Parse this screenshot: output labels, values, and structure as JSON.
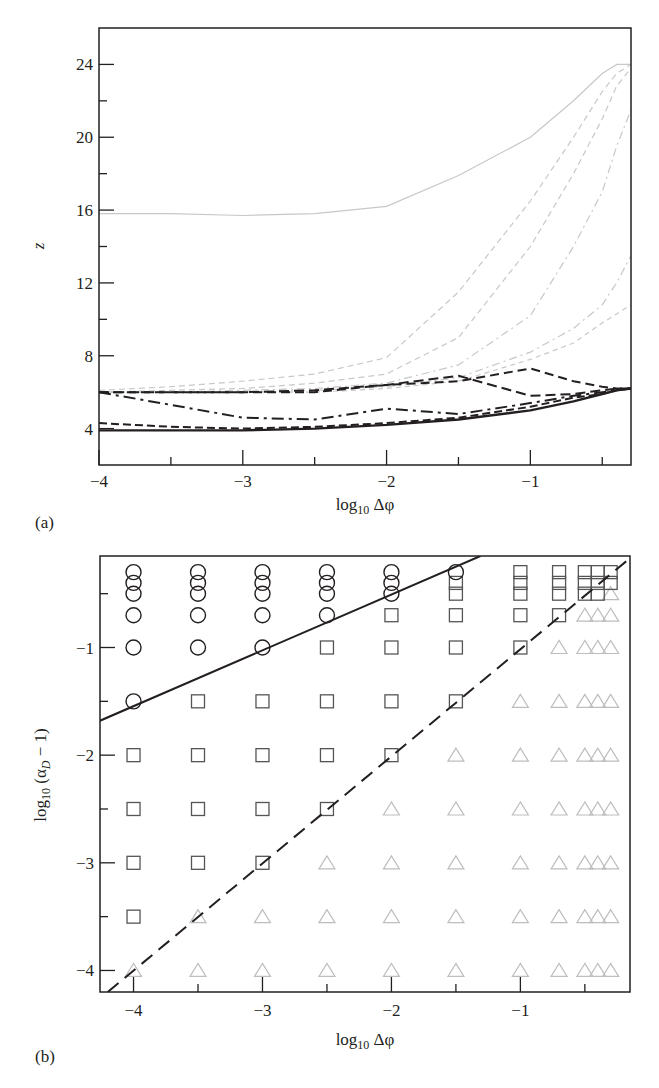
{
  "chart_data": [
    {
      "panel": "(a)",
      "type": "line",
      "title": "",
      "xlabel": "log10 Δφ",
      "ylabel": "z",
      "xlim": [
        -4,
        -0.3
      ],
      "ylim": [
        2,
        26
      ],
      "xticks": [
        -4,
        -3,
        -2,
        -1
      ],
      "xtick_labels": [
        "−4",
        "−3",
        "−2",
        "−1"
      ],
      "yticks": [
        4,
        8,
        12,
        16,
        20,
        24
      ],
      "ytick_labels": [
        "4",
        "8",
        "12",
        "16",
        "20",
        "24"
      ],
      "grid": false,
      "legend": null,
      "x": [
        -4,
        -3.5,
        -3,
        -2.5,
        -2,
        -1.5,
        -1,
        -0.7,
        -0.5,
        -0.4,
        -0.3
      ],
      "series": [
        {
          "name": "series-1",
          "color": "#c8c8c8",
          "dash": "none",
          "width": 1.2,
          "values": [
            15.8,
            15.8,
            15.7,
            15.8,
            16.2,
            17.9,
            20.0,
            22.0,
            23.5,
            24.0,
            24.0
          ]
        },
        {
          "name": "series-2",
          "color": "#c8c8c8",
          "dash": "6,4",
          "width": 1.2,
          "values": [
            6.1,
            6.3,
            6.6,
            7.0,
            7.9,
            11.5,
            16.5,
            20.0,
            22.5,
            23.5,
            24.0
          ]
        },
        {
          "name": "series-3",
          "color": "#c8c8c8",
          "dash": "6,4",
          "width": 1.2,
          "values": [
            6.0,
            6.1,
            6.2,
            6.5,
            7.0,
            9.0,
            14.0,
            18.0,
            21.0,
            22.8,
            23.8
          ]
        },
        {
          "name": "series-4",
          "color": "#c8c8c8",
          "dash": "8,4,2,4",
          "width": 1.2,
          "values": [
            6.0,
            6.0,
            6.1,
            6.2,
            6.5,
            7.5,
            10.2,
            14.0,
            17.0,
            19.5,
            21.5
          ]
        },
        {
          "name": "series-5",
          "color": "#c8c8c8",
          "dash": "8,4,2,4",
          "width": 1.2,
          "values": [
            6.0,
            6.0,
            6.0,
            6.1,
            6.3,
            6.8,
            8.2,
            9.5,
            10.8,
            12.0,
            13.5
          ]
        },
        {
          "name": "series-6",
          "color": "#c8c8c8",
          "dash": "5,4",
          "width": 1.2,
          "values": [
            6.0,
            6.0,
            6.0,
            6.0,
            6.2,
            6.6,
            7.8,
            8.7,
            9.8,
            10.3,
            10.8
          ]
        },
        {
          "name": "series-7",
          "color": "#231f20",
          "dash": "9,5",
          "width": 2.0,
          "values": [
            6.0,
            6.0,
            6.0,
            6.0,
            6.4,
            6.6,
            7.3,
            6.6,
            6.3,
            6.2,
            6.2
          ]
        },
        {
          "name": "series-8",
          "color": "#231f20",
          "dash": "10,5",
          "width": 2.0,
          "values": [
            6.0,
            6.0,
            6.0,
            6.1,
            6.4,
            6.9,
            5.8,
            5.9,
            6.1,
            6.2,
            6.2
          ]
        },
        {
          "name": "series-9",
          "color": "#231f20",
          "dash": "12,5,3,5",
          "width": 2.0,
          "values": [
            6.0,
            5.3,
            4.6,
            4.5,
            5.1,
            4.8,
            5.4,
            5.8,
            6.0,
            6.1,
            6.2
          ]
        },
        {
          "name": "series-10",
          "color": "#231f20",
          "dash": "8,4",
          "width": 2.0,
          "values": [
            4.3,
            4.1,
            4.0,
            4.1,
            4.3,
            4.6,
            5.2,
            5.7,
            5.9,
            6.1,
            6.2
          ]
        },
        {
          "name": "series-11",
          "color": "#231f20",
          "dash": "none",
          "width": 2.4,
          "values": [
            3.9,
            3.9,
            3.9,
            4.0,
            4.2,
            4.5,
            5.0,
            5.5,
            5.9,
            6.1,
            6.2
          ]
        }
      ]
    },
    {
      "panel": "(b)",
      "type": "scatter",
      "title": "",
      "xlabel": "log10 Δφ",
      "ylabel": "log10 (αD − 1)",
      "xlim": [
        -4.26,
        -0.15
      ],
      "ylim": [
        -4.2,
        -0.15
      ],
      "xticks": [
        -4,
        -3,
        -2,
        -1
      ],
      "xtick_labels": [
        "−4",
        "−3",
        "−2",
        "−1"
      ],
      "yticks": [
        -1,
        -2,
        -3,
        -4
      ],
      "ytick_labels": [
        "−1",
        "−2",
        "−3",
        "−4"
      ],
      "grid": false,
      "legend": null,
      "marker_legend": {
        "circle": "#231f20",
        "square": "#555555",
        "triangle": "#bdbdbd"
      },
      "series": [
        {
          "name": "circle",
          "marker": "circle",
          "color": "#231f20",
          "points": [
            [
              -4,
              -0.3
            ],
            [
              -4,
              -0.4
            ],
            [
              -4,
              -0.5
            ],
            [
              -4,
              -0.7
            ],
            [
              -4,
              -1
            ],
            [
              -4,
              -1.5
            ],
            [
              -3.5,
              -0.3
            ],
            [
              -3.5,
              -0.4
            ],
            [
              -3.5,
              -0.5
            ],
            [
              -3.5,
              -0.7
            ],
            [
              -3.5,
              -1
            ],
            [
              -3,
              -0.3
            ],
            [
              -3,
              -0.4
            ],
            [
              -3,
              -0.5
            ],
            [
              -3,
              -0.7
            ],
            [
              -3,
              -1
            ],
            [
              -2.5,
              -0.3
            ],
            [
              -2.5,
              -0.4
            ],
            [
              -2.5,
              -0.5
            ],
            [
              -2.5,
              -0.7
            ],
            [
              -2,
              -0.3
            ],
            [
              -2,
              -0.4
            ],
            [
              -2,
              -0.5
            ],
            [
              -1.5,
              -0.3
            ]
          ]
        },
        {
          "name": "square",
          "marker": "square",
          "color": "#555555",
          "points": [
            [
              -4,
              -2
            ],
            [
              -4,
              -2.5
            ],
            [
              -4,
              -3
            ],
            [
              -4,
              -3.5
            ],
            [
              -3.5,
              -1.5
            ],
            [
              -3.5,
              -2
            ],
            [
              -3.5,
              -2.5
            ],
            [
              -3.5,
              -3
            ],
            [
              -3,
              -1.5
            ],
            [
              -3,
              -2
            ],
            [
              -3,
              -2.5
            ],
            [
              -3,
              -3
            ],
            [
              -2.5,
              -1
            ],
            [
              -2.5,
              -1.5
            ],
            [
              -2.5,
              -2
            ],
            [
              -2.5,
              -2.5
            ],
            [
              -2,
              -0.7
            ],
            [
              -2,
              -1
            ],
            [
              -2,
              -1.5
            ],
            [
              -2,
              -2
            ],
            [
              -1.5,
              -0.4
            ],
            [
              -1.5,
              -0.5
            ],
            [
              -1.5,
              -0.7
            ],
            [
              -1.5,
              -1
            ],
            [
              -1.5,
              -1.5
            ],
            [
              -1,
              -0.3
            ],
            [
              -1,
              -0.4
            ],
            [
              -1,
              -0.5
            ],
            [
              -1,
              -0.7
            ],
            [
              -1,
              -1
            ],
            [
              -0.7,
              -0.3
            ],
            [
              -0.7,
              -0.4
            ],
            [
              -0.7,
              -0.5
            ],
            [
              -0.7,
              -0.7
            ],
            [
              -0.5,
              -0.3
            ],
            [
              -0.5,
              -0.4
            ],
            [
              -0.5,
              -0.5
            ],
            [
              -0.4,
              -0.3
            ],
            [
              -0.4,
              -0.4
            ],
            [
              -0.4,
              -0.5
            ],
            [
              -0.3,
              -0.3
            ],
            [
              -0.3,
              -0.4
            ]
          ]
        },
        {
          "name": "triangle",
          "marker": "triangle",
          "color": "#bdbdbd",
          "points": [
            [
              -4,
              -4
            ],
            [
              -3.5,
              -3.5
            ],
            [
              -3.5,
              -4
            ],
            [
              -3,
              -3.5
            ],
            [
              -3,
              -4
            ],
            [
              -2.5,
              -3
            ],
            [
              -2.5,
              -3.5
            ],
            [
              -2.5,
              -4
            ],
            [
              -2,
              -2.5
            ],
            [
              -2,
              -3
            ],
            [
              -2,
              -3.5
            ],
            [
              -2,
              -4
            ],
            [
              -1.5,
              -2
            ],
            [
              -1.5,
              -2.5
            ],
            [
              -1.5,
              -3
            ],
            [
              -1.5,
              -3.5
            ],
            [
              -1.5,
              -4
            ],
            [
              -1,
              -1.5
            ],
            [
              -1,
              -2
            ],
            [
              -1,
              -2.5
            ],
            [
              -1,
              -3
            ],
            [
              -1,
              -3.5
            ],
            [
              -1,
              -4
            ],
            [
              -0.7,
              -1
            ],
            [
              -0.7,
              -1.5
            ],
            [
              -0.7,
              -2
            ],
            [
              -0.7,
              -2.5
            ],
            [
              -0.7,
              -3
            ],
            [
              -0.7,
              -3.5
            ],
            [
              -0.7,
              -4
            ],
            [
              -0.5,
              -0.7
            ],
            [
              -0.5,
              -1
            ],
            [
              -0.5,
              -1.5
            ],
            [
              -0.5,
              -2
            ],
            [
              -0.5,
              -2.5
            ],
            [
              -0.5,
              -3
            ],
            [
              -0.5,
              -3.5
            ],
            [
              -0.5,
              -4
            ],
            [
              -0.4,
              -0.7
            ],
            [
              -0.4,
              -1
            ],
            [
              -0.4,
              -1.5
            ],
            [
              -0.4,
              -2
            ],
            [
              -0.4,
              -2.5
            ],
            [
              -0.4,
              -3
            ],
            [
              -0.4,
              -3.5
            ],
            [
              -0.4,
              -4
            ],
            [
              -0.3,
              -0.5
            ],
            [
              -0.3,
              -0.7
            ],
            [
              -0.3,
              -1
            ],
            [
              -0.3,
              -1.5
            ],
            [
              -0.3,
              -2
            ],
            [
              -0.3,
              -2.5
            ],
            [
              -0.3,
              -3
            ],
            [
              -0.3,
              -3.5
            ],
            [
              -0.3,
              -4
            ]
          ]
        }
      ],
      "lines": [
        {
          "name": "solid-boundary",
          "style": "solid",
          "color": "#231f20",
          "from": [
            -4.26,
            -1.68
          ],
          "to": [
            -1.31,
            -0.15
          ]
        },
        {
          "name": "dashed-boundary",
          "style": "dashed",
          "color": "#231f20",
          "from": [
            -4.2,
            -4.2
          ],
          "to": [
            -0.18,
            -0.2
          ]
        }
      ]
    }
  ],
  "labels": {
    "panel_a": "(a)",
    "panel_b": "(b)",
    "a_xlabel": "log₁₀ Δφ",
    "a_ylabel": "z",
    "b_xlabel": "log₁₀ Δφ",
    "b_ylabel": "log₁₀ (α_D − 1)"
  }
}
